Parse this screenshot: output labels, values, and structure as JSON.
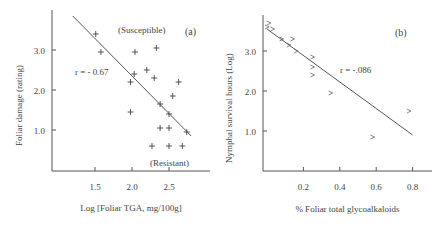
{
  "chart_data": [
    {
      "type": "scatter",
      "panel_label": "(a)",
      "xlabel": "Log [Foliar TGA,  mg/100g]",
      "ylabel": "Foliar damage (rating)",
      "x_ticks": [
        "1.5",
        "2.0",
        "2.5"
      ],
      "y_ticks": [
        "1.0",
        "2.0",
        "3.0"
      ],
      "annotations": {
        "top": "(Susceptible)",
        "bottom": "(Resistant)",
        "r": "r = - 0.67"
      },
      "marker": "+",
      "regression_line": {
        "x1": 1.2,
        "y1": 3.85,
        "x2": 2.8,
        "y2": 0.85
      },
      "points": [
        [
          1.51,
          3.4
        ],
        [
          1.58,
          2.95
        ],
        [
          2.04,
          2.95
        ],
        [
          2.33,
          3.05
        ],
        [
          2.03,
          2.4
        ],
        [
          2.2,
          2.5
        ],
        [
          2.3,
          2.3
        ],
        [
          1.98,
          2.2
        ],
        [
          2.63,
          2.2
        ],
        [
          2.38,
          1.65
        ],
        [
          2.55,
          1.85
        ],
        [
          1.98,
          1.45
        ],
        [
          2.5,
          1.4
        ],
        [
          2.38,
          1.05
        ],
        [
          2.5,
          1.05
        ],
        [
          2.74,
          0.95
        ],
        [
          2.27,
          0.6
        ],
        [
          2.5,
          0.6
        ],
        [
          2.68,
          0.6
        ]
      ]
    },
    {
      "type": "scatter",
      "panel_label": "(b)",
      "xlabel": "% Foliar total glycoalkaloids",
      "ylabel": "Nymphal survival hours (Log)",
      "x_ticks": [
        "0.2",
        "0.4",
        "0.6",
        "0.8"
      ],
      "y_ticks": [
        "1.0",
        "2.0",
        "3.0"
      ],
      "annotations": {
        "r": "r = -.086"
      },
      "marker": ">",
      "regression_line": {
        "x1": 0.0,
        "y1": 3.55,
        "x2": 0.8,
        "y2": 0.9
      },
      "points": [
        [
          0.01,
          3.7
        ],
        [
          0.0,
          3.6
        ],
        [
          0.03,
          3.55
        ],
        [
          0.08,
          3.3
        ],
        [
          0.14,
          3.3
        ],
        [
          0.12,
          3.15
        ],
        [
          0.16,
          3.0
        ],
        [
          0.25,
          2.85
        ],
        [
          0.25,
          2.6
        ],
        [
          0.25,
          2.4
        ],
        [
          0.35,
          1.95
        ],
        [
          0.58,
          0.85
        ],
        [
          0.78,
          1.5
        ]
      ]
    }
  ]
}
